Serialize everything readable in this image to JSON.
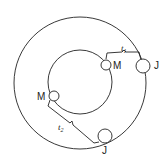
{
  "diagram": {
    "outer_circle": {
      "cx": 80,
      "cy": 83,
      "r": 66
    },
    "inner_circle": {
      "cx": 80,
      "cy": 82,
      "r": 32
    },
    "nodes": [
      {
        "id": "m-inner-top",
        "label": "M",
        "cx": 106,
        "cy": 65,
        "r": 5,
        "label_x": 113,
        "label_y": 69
      },
      {
        "id": "j-outer-right",
        "label": "J",
        "cx": 143,
        "cy": 66,
        "r": 7,
        "label_x": 154,
        "label_y": 69
      },
      {
        "id": "m-inner-left",
        "label": "M",
        "cx": 54,
        "cy": 96,
        "r": 5,
        "label_x": 37,
        "label_y": 100
      },
      {
        "id": "j-outer-bottom",
        "label": "J",
        "cx": 105,
        "cy": 136,
        "r": 7,
        "label_x": 102,
        "label_y": 154
      }
    ],
    "intervals": [
      {
        "id": "t1",
        "base": "t",
        "sub": "1",
        "x": 121,
        "y": 51
      },
      {
        "id": "t2",
        "base": "t",
        "sub": "2",
        "x": 58,
        "y": 130
      }
    ],
    "line_color": "#222222"
  }
}
